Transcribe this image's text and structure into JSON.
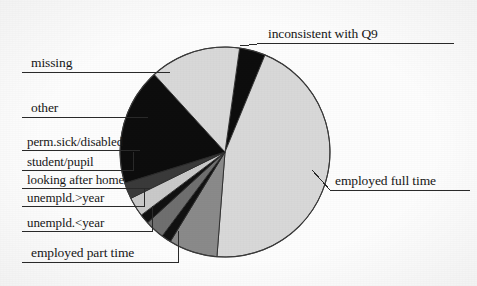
{
  "chart_data": {
    "type": "pie",
    "title": "",
    "subtitle": "",
    "xlabel": "",
    "ylabel": "",
    "legend_position": "callout-labels",
    "grid": false,
    "start_angle_deg": -82,
    "direction": "clockwise",
    "center": {
      "x": 225,
      "y": 152
    },
    "radius": 105,
    "categories": [
      "inconsistent with Q9",
      "employed full time",
      "employed part time",
      "unempld.<year",
      "unempld.>year",
      "looking after home",
      "student/pupil",
      "perm.sick/disabled",
      "other",
      "missing"
    ],
    "values": [
      4.0,
      45.0,
      7.5,
      1.5,
      3.0,
      1.5,
      3.0,
      2.5,
      18.0,
      14.0
    ],
    "units": "percent",
    "colors": [
      "#0d0d0d",
      "#d8d8d8",
      "#8a8a8a",
      "#111111",
      "#6f6f6f",
      "#111111",
      "#c9c9c9",
      "#3a3a3a",
      "#0d0d0d",
      "#d8d8d8"
    ],
    "slice_outline_color": "#2b2b2b"
  },
  "labels": {
    "inconsistent_with_q9": "inconsistent with Q9",
    "employed_full_time": "employed full time",
    "missing": "missing",
    "other": "other",
    "perm_sick_disabled": "perm.sick/disabled",
    "student_pupil": "student/pupil",
    "looking_after_home": "looking after home",
    "unempld_over_year": "unempld.>year",
    "unempld_under_year": "unempld.<year",
    "employed_part_time": "employed part time"
  },
  "style": {
    "background": "#fdfdfd",
    "text_color": "#171717",
    "leader_line_color": "#2a2a2a"
  }
}
